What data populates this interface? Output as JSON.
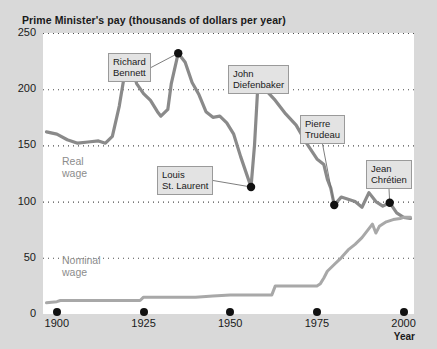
{
  "chart_title": "Prime Minister's pay (thousands of dollars per year)",
  "source_note": "",
  "axes": {
    "x_title": "Year",
    "x_ticks": [
      "1900",
      "1925",
      "1950",
      "1975",
      "2000"
    ],
    "y_ticks": [
      "0",
      "50",
      "100",
      "150",
      "200",
      "250"
    ]
  },
  "series_labels": {
    "real_line1": "Real",
    "real_line2": "wage",
    "nominal_line1": "Nominal",
    "nominal_line2": "wage"
  },
  "annotations": [
    {
      "id": "richard-bennett",
      "line1": "Richard",
      "line2": "Bennett",
      "year": 1935,
      "value": 232
    },
    {
      "id": "louis-st-laurent",
      "line1": "Louis",
      "line2": "St. Laurent",
      "year": 1956,
      "value": 113
    },
    {
      "id": "john-diefenbaker",
      "line1": "John",
      "line2": "Diefenbaker",
      "year": 1958,
      "value": 205
    },
    {
      "id": "pierre-trudeau",
      "line1": "Pierre",
      "line2": "Trudeau",
      "year": 1980,
      "value": 97
    },
    {
      "id": "jean-chretien",
      "line1": "Jean",
      "line2": "Chrétien",
      "year": 1996,
      "value": 99
    }
  ],
  "colors": {
    "page_background": "#d9d9d9",
    "plot_background": "#ffffff",
    "real_wage_line": "#8a8a8a",
    "nominal_wage_line": "#a8a8a8",
    "gridline": "#4d4d4d",
    "marker": "#111111",
    "callout_background": "#e3e3e3",
    "callout_border": "#9a9a9a",
    "text": "#1a1a1a"
  },
  "chart_data": {
    "type": "line",
    "title": "Prime Minister's pay (thousands of dollars per year)",
    "xlabel": "Year",
    "ylabel": "",
    "xlim": [
      1896,
      2003
    ],
    "ylim": [
      0,
      250
    ],
    "grid": true,
    "gridlines_y": [
      0,
      50,
      100,
      150,
      200,
      250
    ],
    "legend": "inline-labels",
    "series": [
      {
        "name": "Real wage",
        "color": "#8a8a8a",
        "x": [
          1897,
          1900,
          1903,
          1906,
          1909,
          1912,
          1914,
          1916,
          1918,
          1920,
          1921,
          1923,
          1925,
          1927,
          1929,
          1930,
          1932,
          1933,
          1935,
          1937,
          1939,
          1941,
          1943,
          1945,
          1947,
          1949,
          1951,
          1953,
          1955,
          1956,
          1957,
          1958,
          1960,
          1963,
          1966,
          1969,
          1972,
          1975,
          1977,
          1978,
          1979,
          1980,
          1982,
          1984,
          1986,
          1988,
          1990,
          1992,
          1994,
          1996,
          1998,
          2000,
          2002
        ],
        "y": [
          162,
          160,
          155,
          152,
          153,
          154,
          152,
          158,
          185,
          222,
          225,
          205,
          196,
          190,
          180,
          176,
          182,
          205,
          232,
          224,
          206,
          195,
          180,
          175,
          176,
          170,
          160,
          140,
          122,
          113,
          150,
          205,
          200,
          190,
          178,
          168,
          152,
          138,
          133,
          120,
          112,
          97,
          104,
          102,
          100,
          95,
          108,
          100,
          96,
          99,
          90,
          86,
          85
        ]
      },
      {
        "name": "Nominal wage",
        "color": "#a8a8a8",
        "x": [
          1897,
          1900,
          1901,
          1905,
          1910,
          1915,
          1920,
          1924,
          1925,
          1930,
          1935,
          1940,
          1945,
          1950,
          1955,
          1960,
          1962,
          1963,
          1968,
          1972,
          1975,
          1976,
          1977,
          1978,
          1980,
          1982,
          1984,
          1986,
          1988,
          1990,
          1991,
          1992,
          1993,
          1995,
          1997,
          1999,
          2000,
          2002
        ],
        "y": [
          10,
          11,
          12,
          12,
          12,
          12,
          12,
          12,
          15,
          15,
          15,
          15,
          16,
          17,
          17,
          17,
          17,
          25,
          25,
          25,
          25,
          27,
          32,
          38,
          44,
          50,
          57,
          62,
          68,
          76,
          80,
          72,
          78,
          82,
          84,
          85,
          86,
          86
        ]
      }
    ]
  }
}
